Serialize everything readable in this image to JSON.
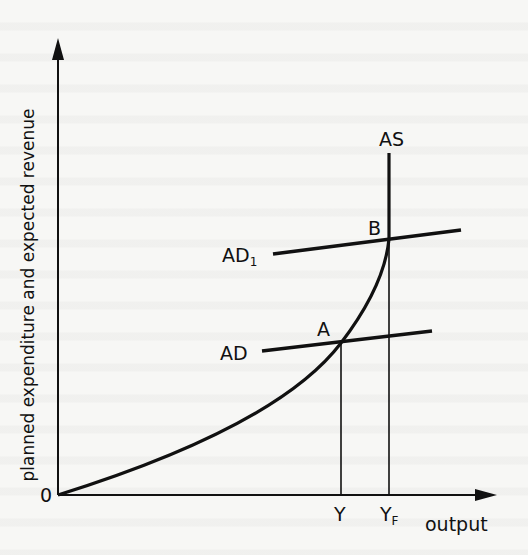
{
  "diagram": {
    "type": "economics-aggregate-supply-demand",
    "y_axis_label": "planned expenditure and expected revenue",
    "x_axis_label": "output",
    "origin_label": "0",
    "curves": {
      "as_label": "AS",
      "ad_label": "AD",
      "ad1_label_main": "AD",
      "ad1_label_sub": "1"
    },
    "points": {
      "a_label": "A",
      "b_label": "B"
    },
    "x_ticks": {
      "y_label": "Y",
      "yf_label_main": "Y",
      "yf_label_sub": "F"
    },
    "colors": {
      "ink": "#111111",
      "paper": "#f7f7f5"
    }
  }
}
